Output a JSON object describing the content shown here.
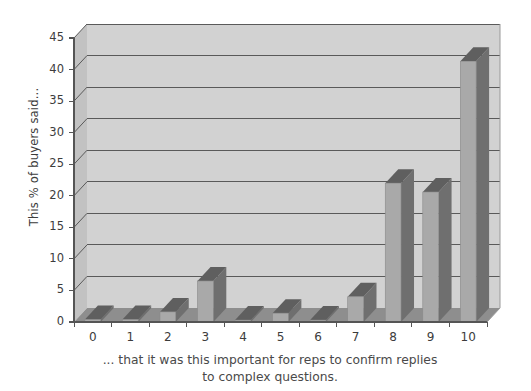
{
  "chart_data": {
    "type": "bar",
    "title": "",
    "subtitle": "",
    "xlabel": "... that it was this important for reps to confirm replies to complex questions.",
    "ylabel": "This % of buyers said...",
    "categories": [
      "0",
      "1",
      "2",
      "3",
      "4",
      "5",
      "6",
      "7",
      "8",
      "9",
      "10"
    ],
    "values": [
      0.4,
      0.4,
      1.6,
      6.5,
      0.3,
      1.4,
      0.3,
      4.0,
      22.0,
      20.6,
      41.3
    ],
    "ylim": [
      0,
      45
    ],
    "y_ticks": [
      "0",
      "5",
      "10",
      "15",
      "20",
      "25",
      "30",
      "35",
      "40",
      "45"
    ],
    "x_ticks": [
      "0",
      "1",
      "2",
      "3",
      "4",
      "5",
      "6",
      "7",
      "8",
      "9",
      "10"
    ],
    "grid": true,
    "legend": false,
    "style": "3d-column",
    "colors": {
      "wall": "#d2d2d2",
      "floor": "#8e8e8e",
      "bar_front": "#a9a9a9",
      "bar_side": "#6f6f6f",
      "bar_top": "#5f5f5f",
      "gridline": "#5a5a5a",
      "axis": "#555555",
      "text": "#3c3c3c",
      "background": "#ffffff"
    }
  },
  "caption": {
    "line1": "... that it was this important for reps to confirm replies",
    "line2": "to complex questions."
  },
  "axis": {
    "y_title": "This % of buyers said..."
  }
}
